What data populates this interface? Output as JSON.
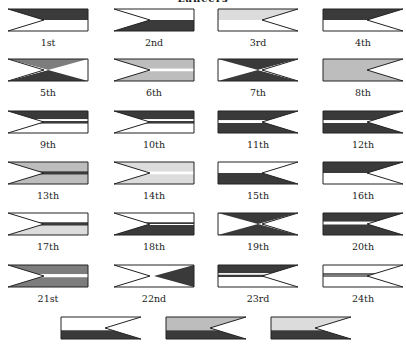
{
  "title": "Lancers",
  "colors": {
    "dark": "#3a3a3a",
    "medium": "#7d7d7d",
    "light": "#bdbdbd",
    "pale": "#dcdcdc",
    "white": "#ffffff",
    "outline": "#222222"
  },
  "pennants": [
    {
      "label": "1st",
      "col": 0,
      "row": 0,
      "bands": [
        [
          "dark",
          0,
          0.5
        ],
        [
          "white",
          0.5,
          1
        ]
      ]
    },
    {
      "label": "2nd",
      "col": 1,
      "row": 0,
      "bands": [
        [
          "white",
          0,
          0.5
        ],
        [
          "dark",
          0.5,
          1
        ]
      ]
    },
    {
      "label": "3rd",
      "col": 2,
      "row": 0,
      "bands": [
        [
          "pale",
          0,
          0.5
        ],
        [
          "white",
          0.5,
          1
        ]
      ]
    },
    {
      "label": "4th",
      "col": 3,
      "row": 0,
      "bands": [
        [
          "dark",
          0,
          0.5
        ],
        [
          "white",
          0.5,
          1
        ]
      ]
    },
    {
      "label": "5th",
      "col": 0,
      "row": 1,
      "style": "saltire",
      "top": "medium",
      "bottom": "dark"
    },
    {
      "label": "6th",
      "col": 1,
      "row": 1,
      "bands": [
        [
          "light",
          0,
          0.44
        ],
        [
          "white",
          0.44,
          0.56
        ],
        [
          "light",
          0.56,
          1
        ]
      ]
    },
    {
      "label": "7th",
      "col": 2,
      "row": 1,
      "style": "saltire",
      "top": "dark",
      "bottom": "dark"
    },
    {
      "label": "8th",
      "col": 3,
      "row": 1,
      "bands": [
        [
          "light",
          0,
          1
        ]
      ]
    },
    {
      "label": "9th",
      "col": 0,
      "row": 2,
      "bands": [
        [
          "dark",
          0,
          0.38
        ],
        [
          "white",
          0.38,
          0.46
        ],
        [
          "dark",
          0.46,
          0.58
        ],
        [
          "white",
          0.58,
          1
        ]
      ]
    },
    {
      "label": "10th",
      "col": 1,
      "row": 2,
      "bands": [
        [
          "dark",
          0,
          0.38
        ],
        [
          "white",
          0.38,
          0.46
        ],
        [
          "dark",
          0.46,
          0.58
        ],
        [
          "white",
          0.58,
          1
        ]
      ]
    },
    {
      "label": "11th",
      "col": 2,
      "row": 2,
      "bands": [
        [
          "dark",
          0,
          0.42
        ],
        [
          "white",
          0.42,
          0.54
        ],
        [
          "dark",
          0.54,
          1
        ]
      ]
    },
    {
      "label": "12th",
      "col": 3,
      "row": 2,
      "bands": [
        [
          "dark",
          0,
          0.42
        ],
        [
          "white",
          0.42,
          0.54
        ],
        [
          "dark",
          0.54,
          1
        ]
      ]
    },
    {
      "label": "13th",
      "col": 0,
      "row": 3,
      "bands": [
        [
          "light",
          0,
          0.42
        ],
        [
          "dark",
          0.42,
          0.58
        ],
        [
          "light",
          0.58,
          1
        ]
      ]
    },
    {
      "label": "14th",
      "col": 1,
      "row": 3,
      "bands": [
        [
          "pale",
          0,
          0.44
        ],
        [
          "white",
          0.44,
          0.56
        ],
        [
          "pale",
          0.56,
          1
        ]
      ]
    },
    {
      "label": "15th",
      "col": 2,
      "row": 3,
      "bands": [
        [
          "white",
          0,
          0.5
        ],
        [
          "dark",
          0.5,
          1
        ]
      ]
    },
    {
      "label": "16th",
      "col": 3,
      "row": 3,
      "bands": [
        [
          "dark",
          0,
          0.5
        ],
        [
          "white",
          0.5,
          1
        ]
      ]
    },
    {
      "label": "17th",
      "col": 0,
      "row": 4,
      "bands": [
        [
          "white",
          0,
          0.42
        ],
        [
          "dark",
          0.42,
          0.58
        ],
        [
          "pale",
          0.58,
          1
        ]
      ]
    },
    {
      "label": "18th",
      "col": 1,
      "row": 4,
      "bands": [
        [
          "white",
          0,
          0.42
        ],
        [
          "dark",
          0.42,
          0.5
        ],
        [
          "white",
          0.5,
          0.54
        ],
        [
          "dark",
          0.54,
          1
        ]
      ]
    },
    {
      "label": "19th",
      "col": 2,
      "row": 4,
      "style": "saltire",
      "top": "dark",
      "bottom": "dark",
      "hoist": "white"
    },
    {
      "label": "20th",
      "col": 3,
      "row": 4,
      "bands": [
        [
          "dark",
          0,
          0.4
        ],
        [
          "white",
          0.4,
          0.52
        ],
        [
          "dark",
          0.52,
          1
        ]
      ]
    },
    {
      "label": "21st",
      "col": 0,
      "row": 5,
      "bands": [
        [
          "medium",
          0,
          0.42
        ],
        [
          "white",
          0.42,
          0.56
        ],
        [
          "medium",
          0.56,
          1
        ]
      ]
    },
    {
      "label": "22nd",
      "col": 1,
      "row": 5,
      "style": "half-saltire",
      "fill": "dark"
    },
    {
      "label": "23rd",
      "col": 2,
      "row": 5,
      "bands": [
        [
          "dark",
          0,
          0.38
        ],
        [
          "white",
          0.38,
          0.44
        ],
        [
          "dark",
          0.44,
          0.54
        ],
        [
          "white",
          0.54,
          1
        ]
      ]
    },
    {
      "label": "24th",
      "col": 3,
      "row": 5,
      "bands": [
        [
          "white",
          0,
          0.38
        ],
        [
          "dark",
          0.38,
          0.44
        ],
        [
          "medium",
          0.44,
          0.54
        ],
        [
          "white",
          0.54,
          1
        ]
      ]
    },
    {
      "label": "",
      "col": 0.5,
      "row": 6,
      "bands": [
        [
          "white",
          0,
          0.6
        ],
        [
          "dark",
          0.6,
          1
        ]
      ]
    },
    {
      "label": "",
      "col": 1.5,
      "row": 6,
      "bands": [
        [
          "light",
          0,
          0.6
        ],
        [
          "dark",
          0.6,
          1
        ]
      ]
    },
    {
      "label": "",
      "col": 2.5,
      "row": 6,
      "bands": [
        [
          "pale",
          0,
          0.6
        ],
        [
          "dark",
          0.6,
          1
        ]
      ]
    }
  ]
}
